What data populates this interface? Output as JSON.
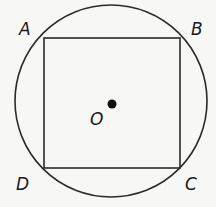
{
  "diagram": {
    "type": "square inscribed in circle",
    "circle": {
      "center_label": "O",
      "cx": 111,
      "cy": 101,
      "r": 96
    },
    "square": {
      "vertices": [
        {
          "label": "A",
          "x": 44,
          "y": 38
        },
        {
          "label": "B",
          "x": 180,
          "y": 38
        },
        {
          "label": "C",
          "x": 180,
          "y": 168
        },
        {
          "label": "D",
          "x": 44,
          "y": 168
        }
      ]
    },
    "center_point": {
      "x": 112,
      "y": 104
    },
    "stroke_color": "#2a2a2a",
    "labels": {
      "A": "A",
      "B": "B",
      "C": "C",
      "D": "D",
      "O": "O"
    }
  }
}
